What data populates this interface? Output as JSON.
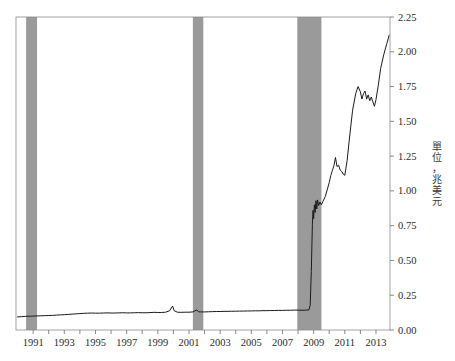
{
  "figure": {
    "background_color": "#ffffff",
    "plot": {
      "left": 16,
      "top": 17,
      "right": 390,
      "bottom": 330,
      "frame_color": "#8c8c8c",
      "frame_width": 0.8
    }
  },
  "axis_title": {
    "text": "單位，兆美元",
    "orientation": "vertical",
    "position": "right"
  },
  "chart_data": {
    "type": "line",
    "title": "",
    "xlabel": "",
    "ylabel": "單位，兆美元",
    "xlim": [
      1989.9,
      2013.9
    ],
    "ylim": [
      0.0,
      2.25
    ],
    "grid": false,
    "legend": null,
    "y_axis_side": "right",
    "yticks": [
      0.0,
      0.25,
      0.5,
      0.75,
      1.0,
      1.25,
      1.5,
      1.75,
      2.0,
      2.25
    ],
    "ytick_labels": [
      "0.00",
      "0.25",
      "0.50",
      "0.75",
      "1.00",
      "1.25",
      "1.50",
      "1.75",
      "2.00",
      "2.25"
    ],
    "xticks": [
      1991,
      1992,
      1993,
      1994,
      1995,
      1996,
      1997,
      1998,
      1999,
      2000,
      2001,
      2002,
      2003,
      2004,
      2005,
      2006,
      2007,
      2008,
      2009,
      2010,
      2011,
      2012,
      2013
    ],
    "xtick_labels_shown": [
      "1991",
      "1993",
      "1995",
      "1997",
      "1999",
      "2001",
      "2003",
      "2005",
      "2007",
      "2009",
      "2011",
      "2013"
    ],
    "line_color": "#1a1a1a",
    "line_width": 1.0,
    "shaded_regions_color": "#9a9a9a",
    "shaded_regions": [
      {
        "label": "recession-1990-1991",
        "x0": 1990.55,
        "x1": 1991.25
      },
      {
        "label": "recession-2001",
        "x0": 2001.25,
        "x1": 2001.92
      },
      {
        "label": "recession-2007-2009",
        "x0": 2007.95,
        "x1": 2009.5
      }
    ],
    "x": [
      1990.0,
      1990.25,
      1990.5,
      1990.75,
      1991.0,
      1991.25,
      1991.5,
      1991.75,
      1992.0,
      1992.25,
      1992.5,
      1992.75,
      1993.0,
      1993.25,
      1993.5,
      1993.75,
      1994.0,
      1994.25,
      1994.5,
      1994.75,
      1995.0,
      1995.25,
      1995.5,
      1995.75,
      1996.0,
      1996.25,
      1996.5,
      1996.75,
      1997.0,
      1997.25,
      1997.5,
      1997.75,
      1998.0,
      1998.25,
      1998.5,
      1998.75,
      1999.0,
      1999.25,
      1999.5,
      1999.75,
      1999.95,
      2000.05,
      2000.25,
      2000.5,
      2000.75,
      2001.0,
      2001.25,
      2001.5,
      2001.6,
      2001.75,
      2002.0,
      2002.25,
      2002.5,
      2002.75,
      2003.0,
      2003.25,
      2003.5,
      2003.75,
      2004.0,
      2004.25,
      2004.5,
      2004.75,
      2005.0,
      2005.25,
      2005.5,
      2005.75,
      2006.0,
      2006.25,
      2006.5,
      2006.75,
      2007.0,
      2007.25,
      2007.5,
      2007.75,
      2008.0,
      2008.25,
      2008.5,
      2008.7,
      2008.78,
      2008.85,
      2008.92,
      2008.96,
      2009.0,
      2009.05,
      2009.1,
      2009.15,
      2009.2,
      2009.25,
      2009.32,
      2009.4,
      2009.5,
      2009.6,
      2009.75,
      2009.9,
      2010.0,
      2010.1,
      2010.2,
      2010.3,
      2010.4,
      2010.5,
      2010.6,
      2010.7,
      2010.8,
      2010.9,
      2011.0,
      2011.15,
      2011.3,
      2011.5,
      2011.7,
      2011.85,
      2012.0,
      2012.1,
      2012.2,
      2012.3,
      2012.4,
      2012.5,
      2012.6,
      2012.7,
      2012.8,
      2012.9,
      2013.0,
      2013.15,
      2013.3,
      2013.5,
      2013.7,
      2013.85
    ],
    "y": [
      0.094,
      0.096,
      0.098,
      0.099,
      0.1,
      0.101,
      0.102,
      0.103,
      0.104,
      0.105,
      0.107,
      0.109,
      0.11,
      0.112,
      0.114,
      0.116,
      0.118,
      0.12,
      0.121,
      0.122,
      0.121,
      0.121,
      0.122,
      0.123,
      0.122,
      0.122,
      0.123,
      0.124,
      0.123,
      0.123,
      0.124,
      0.125,
      0.124,
      0.124,
      0.125,
      0.127,
      0.126,
      0.126,
      0.128,
      0.138,
      0.172,
      0.139,
      0.128,
      0.127,
      0.128,
      0.128,
      0.13,
      0.145,
      0.131,
      0.13,
      0.13,
      0.131,
      0.132,
      0.133,
      0.133,
      0.134,
      0.134,
      0.135,
      0.135,
      0.136,
      0.136,
      0.137,
      0.137,
      0.138,
      0.138,
      0.139,
      0.139,
      0.14,
      0.14,
      0.141,
      0.141,
      0.142,
      0.142,
      0.143,
      0.143,
      0.142,
      0.143,
      0.145,
      0.18,
      0.42,
      0.76,
      0.86,
      0.8,
      0.9,
      0.845,
      0.93,
      0.87,
      0.935,
      0.895,
      0.92,
      0.9,
      0.925,
      0.96,
      1.02,
      1.06,
      1.11,
      1.145,
      1.18,
      1.24,
      1.175,
      1.185,
      1.15,
      1.14,
      1.12,
      1.112,
      1.22,
      1.38,
      1.58,
      1.7,
      1.75,
      1.712,
      1.66,
      1.7,
      1.718,
      1.66,
      1.69,
      1.648,
      1.675,
      1.64,
      1.608,
      1.655,
      1.76,
      1.88,
      1.98,
      2.06,
      2.12
    ]
  }
}
